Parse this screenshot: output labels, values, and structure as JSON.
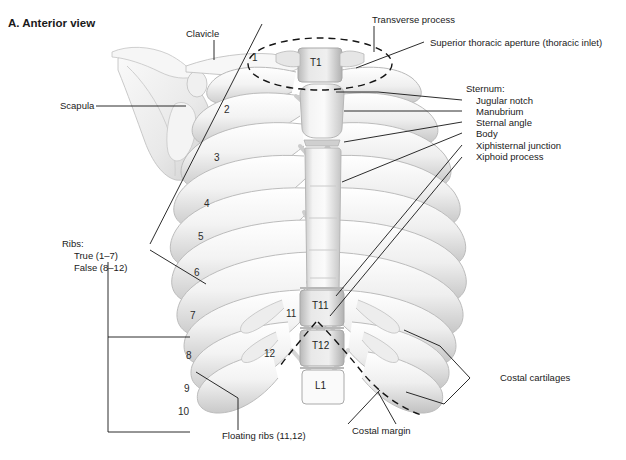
{
  "figure": {
    "title": "A. Anterior view",
    "background": "#ffffff",
    "ink": "#1a1a1a",
    "bone_light": "#f2f2f2",
    "bone_mid": "#d9d9d9",
    "bone_dark": "#b4b4b4",
    "bone_shadow": "#9a9a9a"
  },
  "labels": {
    "clavicle": "Clavicle",
    "scapula": "Scapula",
    "transverse_process": "Transverse process",
    "superior_thoracic_aperture": "Superior thoracic aperture (thoracic inlet)",
    "sternum_heading": "Sternum:",
    "jugular_notch": "Jugular notch",
    "manubrium": "Manubrium",
    "sternal_angle": "Sternal angle",
    "body": "Body",
    "xiphisternal_junction": "Xiphisternal junction",
    "xiphoid_process": "Xiphoid process",
    "ribs_heading": "Ribs:",
    "ribs_true": "True (1–7)",
    "ribs_false": "False (8–12)",
    "floating_ribs": "Floating ribs (11,12)",
    "costal_margin": "Costal margin",
    "costal_cartilages": "Costal cartilages"
  },
  "vertebrae": [
    {
      "id": "T1",
      "text": "T1"
    },
    {
      "id": "T11",
      "text": "T11"
    },
    {
      "id": "T12",
      "text": "T12"
    },
    {
      "id": "L1",
      "text": "L1"
    }
  ],
  "rib_numbers": [
    {
      "id": "rib-1",
      "text": "1"
    },
    {
      "id": "rib-2",
      "text": "2"
    },
    {
      "id": "rib-3",
      "text": "3"
    },
    {
      "id": "rib-4",
      "text": "4"
    },
    {
      "id": "rib-5",
      "text": "5"
    },
    {
      "id": "rib-6",
      "text": "6"
    },
    {
      "id": "rib-7",
      "text": "7"
    },
    {
      "id": "rib-8",
      "text": "8"
    },
    {
      "id": "rib-9",
      "text": "9"
    },
    {
      "id": "rib-10",
      "text": "10"
    },
    {
      "id": "rib-11",
      "text": "11"
    },
    {
      "id": "rib-12",
      "text": "12"
    }
  ]
}
